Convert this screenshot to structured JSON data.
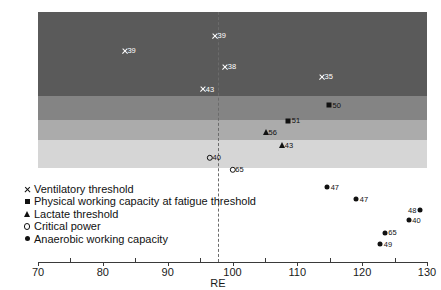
{
  "chart_data": {
    "type": "scatter",
    "title": "",
    "xlabel": "RE",
    "ylabel": "",
    "xlim": [
      70,
      130
    ],
    "ylim": [
      0,
      1
    ],
    "grid": false,
    "legend_position": "lower-left",
    "xticks": [
      70,
      80,
      90,
      100,
      110,
      120,
      130
    ],
    "xticklabels": [
      "70",
      "80",
      "90",
      "100",
      "110",
      "120",
      "130"
    ],
    "reference_line": {
      "x": 100,
      "style": "dashed",
      "color": "#6b6b6b"
    },
    "bands": [
      {
        "name": "ventilatory-threshold-band",
        "color": "#5a5a5a"
      },
      {
        "name": "pwcft-band",
        "color": "#848484"
      },
      {
        "name": "lactate-threshold-band",
        "color": "#ababab"
      },
      {
        "name": "critical-power-band",
        "color": "#d6d6d6"
      }
    ],
    "series": [
      {
        "name": "Ventilatory threshold",
        "marker": "x",
        "color": "#ffffff",
        "points": [
          {
            "x": 97.3,
            "y": 0.905,
            "label": "39",
            "label_side": "right"
          },
          {
            "x": 83.4,
            "y": 0.845,
            "label": "39",
            "label_side": "right"
          },
          {
            "x": 98.9,
            "y": 0.782,
            "label": "38",
            "label_side": "right"
          },
          {
            "x": 113.8,
            "y": 0.742,
            "label": "35",
            "label_side": "right"
          },
          {
            "x": 95.5,
            "y": 0.692,
            "label": "43",
            "label_side": "right"
          }
        ]
      },
      {
        "name": "Physical working capacity at fatigue threshold",
        "marker": "square",
        "color": "#111111",
        "points": [
          {
            "x": 114.9,
            "y": 0.628,
            "label": "50",
            "label_side": "right"
          },
          {
            "x": 108.6,
            "y": 0.566,
            "label": "51",
            "label_side": "right"
          }
        ]
      },
      {
        "name": "Lactate threshold",
        "marker": "triangle",
        "color": "#111111",
        "points": [
          {
            "x": 105.1,
            "y": 0.52,
            "label": "56",
            "label_side": "right"
          },
          {
            "x": 107.6,
            "y": 0.47,
            "label": "43",
            "label_side": "right"
          }
        ]
      },
      {
        "name": "Critical power",
        "marker": "circle-open",
        "color": "#111111",
        "points": [
          {
            "x": 96.5,
            "y": 0.418,
            "label": "40",
            "label_side": "right"
          },
          {
            "x": 100.0,
            "y": 0.368,
            "label": "65",
            "label_side": "right"
          }
        ]
      },
      {
        "name": "Anaerobic working capacity",
        "marker": "circle-filled",
        "color": "#111111",
        "points": [
          {
            "x": 114.6,
            "y": 0.3,
            "label": "47",
            "label_side": "right"
          },
          {
            "x": 119.1,
            "y": 0.252,
            "label": "47",
            "label_side": "right"
          },
          {
            "x": 128.9,
            "y": 0.208,
            "label": "48",
            "label_side": "left"
          },
          {
            "x": 127.2,
            "y": 0.168,
            "label": "40",
            "label_side": "right"
          },
          {
            "x": 123.5,
            "y": 0.118,
            "label": "65",
            "label_side": "right"
          },
          {
            "x": 122.8,
            "y": 0.072,
            "label": "49",
            "label_side": "right"
          }
        ]
      }
    ],
    "legend_entries": [
      {
        "marker": "x",
        "label": "Ventilatory threshold"
      },
      {
        "marker": "square",
        "label": "Physical working capacity at fatigue threshold"
      },
      {
        "marker": "triangle",
        "label": "Lactate threshold"
      },
      {
        "marker": "circle-open",
        "label": "Critical power"
      },
      {
        "marker": "circle-filled",
        "label": "Anaerobic working capacity"
      }
    ]
  }
}
